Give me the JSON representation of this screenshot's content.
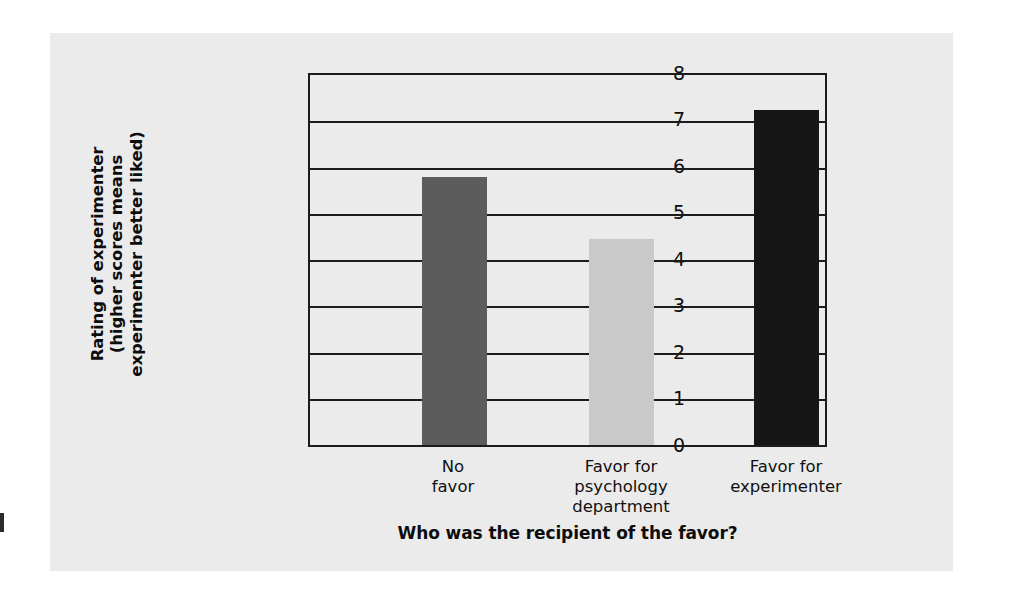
{
  "chart_data": {
    "type": "bar",
    "title": "",
    "categories": [
      "No favor",
      "Favor for psychology department",
      "Favor for experimenter"
    ],
    "category_lines": [
      [
        "No",
        "favor"
      ],
      [
        "Favor for",
        "psychology",
        "department"
      ],
      [
        "Favor for",
        "experimenter"
      ]
    ],
    "values": [
      5.8,
      4.45,
      7.25
    ],
    "xlabel": "Who was the recipient of the favor?",
    "ylabel": "Rating of experimenter (higher scores means experimenter better liked)",
    "ylabel_lines": [
      "Rating of experimenter",
      "(higher scores means",
      "experimenter better liked)"
    ],
    "ylim": [
      0,
      8
    ],
    "ytick_labels": [
      "8",
      "7",
      "6",
      "5",
      "4",
      "3",
      "2",
      "1",
      "0"
    ],
    "ytick_values": [
      8,
      7,
      6,
      5,
      4,
      3,
      2,
      1,
      0
    ],
    "grid": true,
    "grid_axis": "y",
    "legend": "none",
    "bar_colors": [
      "#5c5c5c",
      "#c9c9c9",
      "#161616"
    ],
    "panel_color": "#ebebeb",
    "axis_color": "#1c1c1c"
  }
}
